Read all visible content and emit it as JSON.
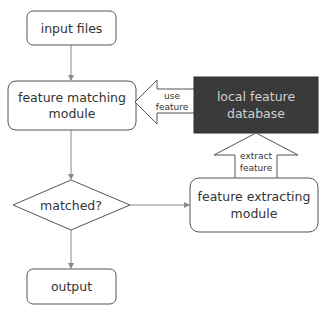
{
  "diagram": {
    "type": "flowchart",
    "colors": {
      "stroke": "#555555",
      "connector": "#8a8a8a",
      "dark_box_fill": "#3a3a3a",
      "dark_box_text": "#d0d0d0",
      "text": "#333333"
    },
    "nodes": {
      "input_files": {
        "label": "input files",
        "shape": "rounded-rect"
      },
      "feature_matching": {
        "line1": "feature matching",
        "line2": "module",
        "shape": "rounded-rect"
      },
      "local_db": {
        "line1": "local feature",
        "line2": "database",
        "shape": "dark-rect"
      },
      "matched": {
        "label": "matched?",
        "shape": "diamond"
      },
      "feature_extracting": {
        "line1": "feature extracting",
        "line2": "module",
        "shape": "rounded-rect"
      },
      "output": {
        "label": "output",
        "shape": "rounded-rect"
      }
    },
    "block_arrows": {
      "use_feature": {
        "line1": "use",
        "line2": "feature",
        "from": "local_db",
        "to": "feature_matching"
      },
      "extract_feature": {
        "line1": "extract",
        "line2": "feature",
        "from": "feature_extracting",
        "to": "local_db"
      }
    },
    "edges": [
      {
        "from": "input_files",
        "to": "feature_matching"
      },
      {
        "from": "feature_matching",
        "to": "matched"
      },
      {
        "from": "matched",
        "to": "feature_extracting"
      },
      {
        "from": "matched",
        "to": "output"
      }
    ]
  }
}
